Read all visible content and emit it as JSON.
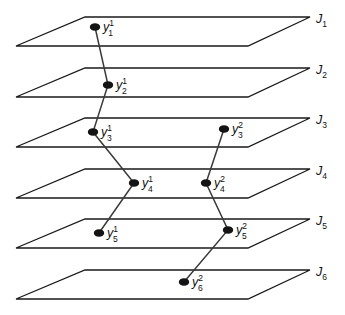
{
  "figure": {
    "width": 345,
    "height": 315,
    "background_color": "#ffffff",
    "line_color": "#1a1a1a",
    "node_color": "#141414",
    "chain_color": "#3a3a3a"
  },
  "chart_data": {
    "type": "diagram",
    "title": "",
    "xlabel": "",
    "ylabel": "",
    "layers": [
      {
        "id": "J1",
        "label": "J",
        "subscript": "1",
        "index": 1,
        "bottom_left_x": 16,
        "bottom_y": 46,
        "top_y": 17
      },
      {
        "id": "J2",
        "label": "J",
        "subscript": "2",
        "index": 2,
        "bottom_left_x": 16,
        "bottom_y": 97,
        "top_y": 68
      },
      {
        "id": "J3",
        "label": "J",
        "subscript": "3",
        "index": 3,
        "bottom_left_x": 16,
        "bottom_y": 147,
        "top_y": 118
      },
      {
        "id": "J4",
        "label": "J",
        "subscript": "4",
        "index": 4,
        "bottom_left_x": 16,
        "bottom_y": 198,
        "top_y": 169
      },
      {
        "id": "J5",
        "label": "J",
        "subscript": "5",
        "index": 5,
        "bottom_left_x": 16,
        "bottom_y": 248,
        "top_y": 219
      },
      {
        "id": "J6",
        "label": "J",
        "subscript": "6",
        "index": 6,
        "bottom_left_x": 16,
        "bottom_y": 299,
        "top_y": 270
      }
    ],
    "nodes": [
      {
        "id": "y_1_1",
        "base": "y",
        "subscript": "1",
        "superscript": "1",
        "layer": "J1",
        "chain": 1,
        "x": 95,
        "y": 27,
        "label_x": 103,
        "label_y": 31
      },
      {
        "id": "y_2_1",
        "base": "y",
        "subscript": "2",
        "superscript": "1",
        "layer": "J2",
        "chain": 1,
        "x": 108,
        "y": 85,
        "label_x": 116,
        "label_y": 89
      },
      {
        "id": "y_3_1",
        "base": "y",
        "subscript": "3",
        "superscript": "1",
        "layer": "J3",
        "chain": 1,
        "x": 93,
        "y": 132,
        "label_x": 101,
        "label_y": 136
      },
      {
        "id": "y_4_1",
        "base": "y",
        "subscript": "4",
        "superscript": "1",
        "layer": "J4",
        "chain": 1,
        "x": 134,
        "y": 183,
        "label_x": 142,
        "label_y": 187
      },
      {
        "id": "y_5_1",
        "base": "y",
        "subscript": "5",
        "superscript": "1",
        "layer": "J5",
        "chain": 1,
        "x": 99,
        "y": 233,
        "label_x": 107,
        "label_y": 237
      },
      {
        "id": "y_3_2",
        "base": "y",
        "subscript": "3",
        "superscript": "2",
        "layer": "J3",
        "chain": 2,
        "x": 224,
        "y": 129,
        "label_x": 232,
        "label_y": 133
      },
      {
        "id": "y_4_2",
        "base": "y",
        "subscript": "4",
        "superscript": "2",
        "layer": "J4",
        "chain": 2,
        "x": 206,
        "y": 183,
        "label_x": 214,
        "label_y": 187
      },
      {
        "id": "y_5_2",
        "base": "y",
        "subscript": "5",
        "superscript": "2",
        "layer": "J5",
        "chain": 2,
        "x": 228,
        "y": 230,
        "label_x": 236,
        "label_y": 234
      },
      {
        "id": "y_6_2",
        "base": "y",
        "subscript": "6",
        "superscript": "2",
        "layer": "J6",
        "chain": 2,
        "x": 184,
        "y": 282,
        "label_x": 192,
        "label_y": 286
      }
    ],
    "chains": [
      {
        "id": "chain-1",
        "superscript": "1",
        "node_ids": [
          "y_1_1",
          "y_2_1",
          "y_3_1",
          "y_4_1",
          "y_5_1"
        ]
      },
      {
        "id": "chain-2",
        "superscript": "2",
        "node_ids": [
          "y_3_2",
          "y_4_2",
          "y_5_2",
          "y_6_2"
        ]
      }
    ]
  }
}
